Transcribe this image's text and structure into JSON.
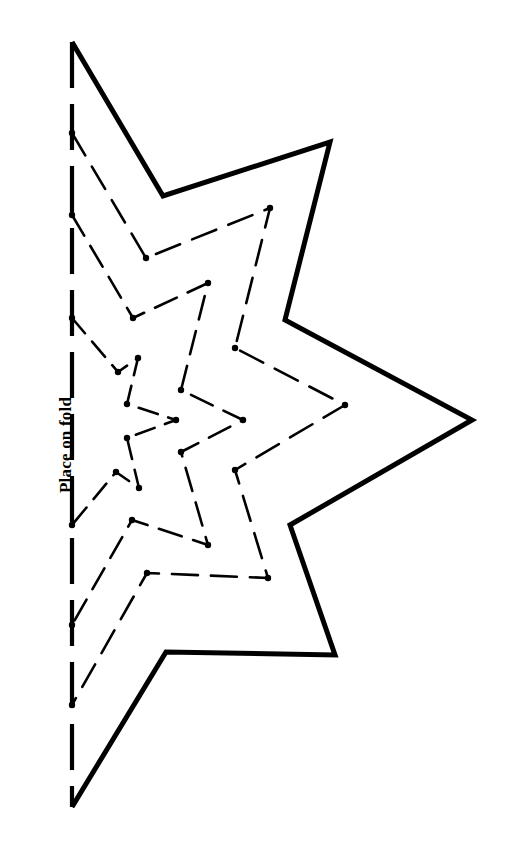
{
  "page": {
    "background_color": "#ffffff",
    "ink_color": "#000000",
    "width": 517,
    "height": 854
  },
  "labels": {
    "fold_label": "Place on fold",
    "fold_label_rotation": "-90deg",
    "fold_label_font_weight": "bold",
    "fold_label_color": "#000000"
  },
  "fold_line": {
    "name": "place-on-fold-line",
    "style": "dashed",
    "x": 72,
    "y_start": 42,
    "y_end": 807,
    "stroke_width": 4.2,
    "dash_pattern": "46 16",
    "color": "#000000"
  },
  "outer_star": {
    "name": "outer-star-outline",
    "style": "solid",
    "stroke_width": 5.0,
    "color": "#000000",
    "points": [
      [
        72,
        42
      ],
      [
        163,
        196
      ],
      [
        330,
        142
      ],
      [
        285,
        320
      ],
      [
        472,
        420
      ],
      [
        290,
        525
      ],
      [
        335,
        655
      ],
      [
        166,
        652
      ],
      [
        72,
        807
      ]
    ]
  },
  "inner_stars": [
    {
      "name": "inner-star-guide-1",
      "style": "dashed",
      "stroke_width": 2.6,
      "dash_pattern": "26 13",
      "color": "#000000",
      "dot_radius": 3.2,
      "points": [
        [
          72,
          133
        ],
        [
          146,
          258
        ],
        [
          270,
          208
        ],
        [
          235,
          348
        ],
        [
          345,
          405
        ],
        [
          235,
          470
        ],
        [
          268,
          578
        ],
        [
          147,
          573
        ],
        [
          72,
          705
        ]
      ]
    },
    {
      "name": "inner-star-guide-2",
      "style": "dashed",
      "stroke_width": 2.6,
      "dash_pattern": "24 12",
      "color": "#000000",
      "dot_radius": 3.2,
      "points": [
        [
          72,
          215
        ],
        [
          133,
          318
        ],
        [
          208,
          283
        ],
        [
          181,
          390
        ],
        [
          243,
          420
        ],
        [
          181,
          452
        ],
        [
          208,
          545
        ],
        [
          132,
          520
        ],
        [
          72,
          625
        ]
      ]
    },
    {
      "name": "inner-star-guide-3",
      "style": "dashed",
      "stroke_width": 2.6,
      "dash_pattern": "20 11",
      "color": "#000000",
      "dot_radius": 3.2,
      "points": [
        [
          72,
          318
        ],
        [
          118,
          372
        ],
        [
          138,
          358
        ],
        [
          127,
          404
        ],
        [
          176,
          420
        ],
        [
          127,
          438
        ],
        [
          139,
          488
        ],
        [
          116,
          472
        ],
        [
          72,
          525
        ]
      ]
    }
  ]
}
